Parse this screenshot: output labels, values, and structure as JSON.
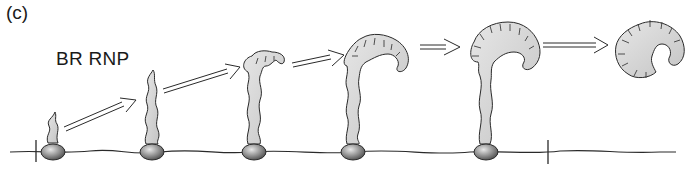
{
  "figure": {
    "panel_label": "(c)",
    "title": "BR RNP"
  },
  "diagram": {
    "stages": [
      {
        "id": 1,
        "polymerase_x": 53,
        "shape": "short-stem"
      },
      {
        "id": 2,
        "polymerase_x": 152,
        "shape": "stem"
      },
      {
        "id": 3,
        "polymerase_x": 254,
        "shape": "stem-small-head"
      },
      {
        "id": 4,
        "polymerase_x": 353,
        "shape": "stem-curled-head"
      },
      {
        "id": 5,
        "polymerase_x": 486,
        "shape": "stem-large-head"
      },
      {
        "id": 6,
        "polymerase_x": null,
        "shape": "released-granule"
      }
    ],
    "arrows": 5,
    "colors": {
      "fill": "#d8d8d8",
      "stroke": "#2a2a2a",
      "polymerase": "#7a7a7a"
    }
  }
}
